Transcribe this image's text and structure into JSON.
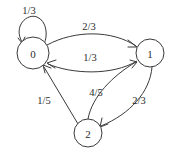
{
  "diagram": {
    "type": "markov-chain-state-diagram",
    "title": "",
    "background_color": "#ffffff",
    "stroke_color": "#3a3a3a",
    "text_color": "#2b2b2b",
    "nodes": [
      {
        "id": "0",
        "label": "0",
        "cx": 33,
        "cy": 53,
        "r": 16
      },
      {
        "id": "1",
        "label": "1",
        "cx": 150,
        "cy": 53,
        "r": 14
      },
      {
        "id": "2",
        "label": "2",
        "cx": 88,
        "cy": 133,
        "r": 14
      }
    ],
    "edges": [
      {
        "id": "e-0-0",
        "from": "0",
        "to": "0",
        "label": "1/3",
        "label_x": 29,
        "label_y": 10,
        "kind": "self-loop"
      },
      {
        "id": "e-0-1",
        "from": "0",
        "to": "1",
        "label": "2/3",
        "label_x": 89,
        "label_y": 26,
        "kind": "curve-upper"
      },
      {
        "id": "e-1-0",
        "from": "1",
        "to": "0",
        "label": "1/3",
        "label_x": 90,
        "label_y": 57,
        "kind": "curve-lower"
      },
      {
        "id": "e-2-0",
        "from": "2",
        "to": "0",
        "label": "1/5",
        "label_x": 44,
        "label_y": 100,
        "kind": "straight"
      },
      {
        "id": "e-2-1",
        "from": "2",
        "to": "1",
        "label": "4/5",
        "label_x": 96,
        "label_y": 92,
        "kind": "curve-left"
      },
      {
        "id": "e-1-2",
        "from": "1",
        "to": "2",
        "label": "2/3",
        "label_x": 139,
        "label_y": 100,
        "kind": "curve-right"
      }
    ]
  }
}
